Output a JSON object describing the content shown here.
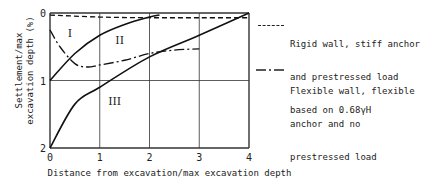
{
  "chart_data": {
    "type": "line",
    "title": "",
    "xlabel": "Distance from excavation/max excavation depth",
    "ylabel": "Settlement/max excavation depth (%)",
    "xlim": [
      0,
      4
    ],
    "ylim": [
      2,
      0
    ],
    "y_inverted": true,
    "x_ticks": [
      "0",
      "1",
      "2",
      "3",
      "4"
    ],
    "y_ticks": [
      "0",
      "1",
      "2"
    ],
    "grid": true,
    "regions": [
      {
        "label": "I",
        "x": 0.4,
        "y": 0.3
      },
      {
        "label": "II",
        "x": 1.4,
        "y": 0.4
      },
      {
        "label": "III",
        "x": 1.3,
        "y": 1.3
      }
    ],
    "boundary_curves": [
      {
        "name": "Boundary I/II",
        "x": [
          0,
          0.5,
          1.0,
          1.5,
          2.0,
          2.2
        ],
        "y": [
          1.0,
          0.6,
          0.33,
          0.17,
          0.06,
          0.03
        ]
      },
      {
        "name": "Boundary II/III",
        "x": [
          0,
          0.5,
          1.0,
          2.0,
          3.0,
          4.0
        ],
        "y": [
          2.0,
          1.35,
          1.1,
          0.65,
          0.33,
          0.0
        ]
      }
    ],
    "series": [
      {
        "name": "Rigid wall, stiff anchor and prestressed load based on 0.68γH",
        "style": "dashed",
        "x": [
          0,
          1,
          2,
          3,
          4
        ],
        "y": [
          0.03,
          0.06,
          0.07,
          0.07,
          0.07
        ]
      },
      {
        "name": "Flexible wall, flexible anchor and no prestressed load",
        "style": "dash-dot",
        "x": [
          0,
          0.2,
          0.5,
          0.75,
          1.0,
          1.5,
          2.0,
          2.5,
          3.0
        ],
        "y": [
          0.25,
          0.5,
          0.75,
          0.8,
          0.77,
          0.7,
          0.6,
          0.55,
          0.53
        ]
      }
    ],
    "legend_position": "right"
  },
  "legend": {
    "rigid_lines": [
      "Rigid wall, stiff anchor",
      "and prestressed load",
      "based on 0.68γH"
    ],
    "flexible_lines": [
      "Flexible wall, flexible",
      "anchor and no",
      "prestressed load"
    ]
  }
}
